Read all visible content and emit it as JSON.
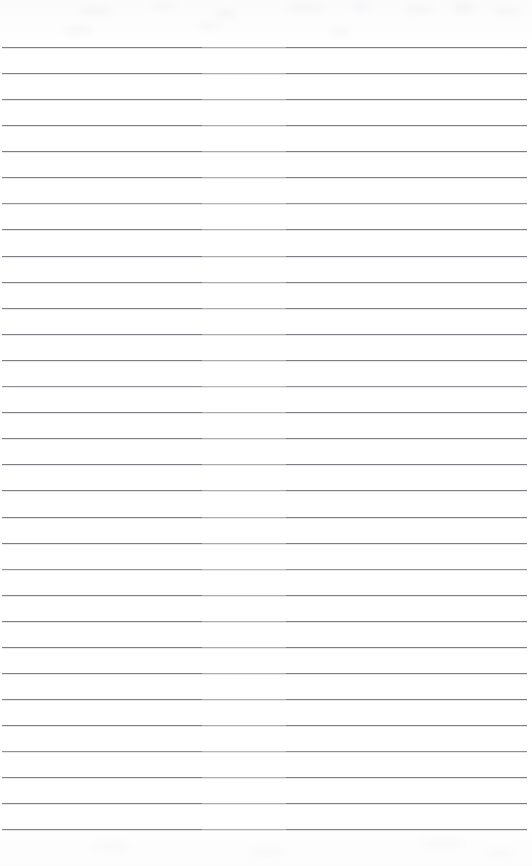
{
  "document": {
    "kind": "scanned-lined-paper",
    "title": "Blank ruled notebook page",
    "page_width": 532,
    "page_height": 866,
    "background_color": "#ffffff",
    "rule_color": "#7d7f85",
    "rule_thickness_px": 1,
    "rule_spacing_px": 26,
    "first_rule_y": 47,
    "rule_left_x": 2,
    "rule_right_x": 527,
    "rule_count": 31,
    "top_margin_px": 47,
    "bottom_margin_px": 37,
    "text_content": "",
    "handwriting_present": "none",
    "rules": [
      {
        "index": 1,
        "y": 47,
        "left": 2,
        "right": 527
      },
      {
        "index": 2,
        "y": 73,
        "left": 2,
        "right": 527
      },
      {
        "index": 3,
        "y": 99,
        "left": 2,
        "right": 527
      },
      {
        "index": 4,
        "y": 125,
        "left": 2,
        "right": 527
      },
      {
        "index": 5,
        "y": 151,
        "left": 2,
        "right": 527
      },
      {
        "index": 6,
        "y": 177,
        "left": 2,
        "right": 527
      },
      {
        "index": 7,
        "y": 203,
        "left": 2,
        "right": 527
      },
      {
        "index": 8,
        "y": 229,
        "left": 2,
        "right": 527
      },
      {
        "index": 9,
        "y": 256,
        "left": 2,
        "right": 527
      },
      {
        "index": 10,
        "y": 282,
        "left": 2,
        "right": 527
      },
      {
        "index": 11,
        "y": 308,
        "left": 2,
        "right": 527
      },
      {
        "index": 12,
        "y": 334,
        "left": 2,
        "right": 527
      },
      {
        "index": 13,
        "y": 360,
        "left": 2,
        "right": 527
      },
      {
        "index": 14,
        "y": 386,
        "left": 2,
        "right": 527
      },
      {
        "index": 15,
        "y": 412,
        "left": 2,
        "right": 527
      },
      {
        "index": 16,
        "y": 438,
        "left": 2,
        "right": 527
      },
      {
        "index": 17,
        "y": 464,
        "left": 2,
        "right": 527
      },
      {
        "index": 18,
        "y": 490,
        "left": 2,
        "right": 527
      },
      {
        "index": 19,
        "y": 517,
        "left": 2,
        "right": 527
      },
      {
        "index": 20,
        "y": 543,
        "left": 2,
        "right": 527
      },
      {
        "index": 21,
        "y": 569,
        "left": 2,
        "right": 527
      },
      {
        "index": 22,
        "y": 595,
        "left": 2,
        "right": 527
      },
      {
        "index": 23,
        "y": 621,
        "left": 2,
        "right": 527
      },
      {
        "index": 24,
        "y": 647,
        "left": 2,
        "right": 527
      },
      {
        "index": 25,
        "y": 673,
        "left": 2,
        "right": 527
      },
      {
        "index": 26,
        "y": 699,
        "left": 2,
        "right": 527
      },
      {
        "index": 27,
        "y": 725,
        "left": 2,
        "right": 527
      },
      {
        "index": 28,
        "y": 751,
        "left": 2,
        "right": 527
      },
      {
        "index": 29,
        "y": 777,
        "left": 2,
        "right": 527
      },
      {
        "index": 30,
        "y": 803,
        "left": 2,
        "right": 527
      },
      {
        "index": 31,
        "y": 829,
        "left": 2,
        "right": 527
      }
    ],
    "scan_artifacts": [
      {
        "x": 78,
        "y": 6,
        "w": 34,
        "h": 9
      },
      {
        "x": 150,
        "y": 3,
        "w": 26,
        "h": 7
      },
      {
        "x": 214,
        "y": 9,
        "w": 22,
        "h": 10
      },
      {
        "x": 286,
        "y": 4,
        "w": 40,
        "h": 8
      },
      {
        "x": 352,
        "y": 2,
        "w": 18,
        "h": 9
      },
      {
        "x": 404,
        "y": 5,
        "w": 30,
        "h": 8
      },
      {
        "x": 452,
        "y": 2,
        "w": 24,
        "h": 11
      },
      {
        "x": 492,
        "y": 7,
        "w": 28,
        "h": 8
      },
      {
        "x": 64,
        "y": 26,
        "w": 30,
        "h": 8
      },
      {
        "x": 196,
        "y": 22,
        "w": 24,
        "h": 7
      },
      {
        "x": 330,
        "y": 28,
        "w": 20,
        "h": 7
      }
    ],
    "scan_artifacts_bottom": [
      {
        "x": 90,
        "y": 12,
        "w": 40,
        "h": 9
      },
      {
        "x": 250,
        "y": 18,
        "w": 34,
        "h": 8
      },
      {
        "x": 420,
        "y": 8,
        "w": 46,
        "h": 10
      },
      {
        "x": 486,
        "y": 20,
        "w": 26,
        "h": 7
      }
    ]
  }
}
